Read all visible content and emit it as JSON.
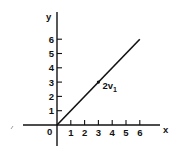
{
  "chart_data": {
    "type": "line",
    "title": "",
    "xlabel": "x",
    "ylabel": "y",
    "origin_label": "0",
    "x_ticks": [
      "1",
      "2",
      "3",
      "4",
      "5",
      "6"
    ],
    "y_ticks": [
      "1",
      "2",
      "3",
      "4",
      "5",
      "6"
    ],
    "xlim": [
      0,
      6
    ],
    "ylim": [
      0,
      6
    ],
    "grid": false,
    "series": [
      {
        "name": "2v1",
        "x": [
          0,
          6
        ],
        "y": [
          0,
          6
        ]
      }
    ],
    "annotations": [
      {
        "text": "2v",
        "subscript": "1",
        "x": 3,
        "y": 3,
        "marker": "dot"
      }
    ]
  }
}
